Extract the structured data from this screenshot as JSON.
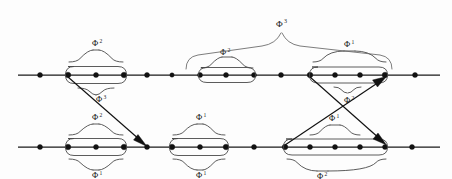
{
  "figure": {
    "background_color": "#fdfdfd",
    "ink_color": "#111111",
    "brace_color": "#4a4a4a",
    "width": 452,
    "height": 179,
    "symbol_base": "Φ"
  },
  "lines": [
    {
      "id": "top-line",
      "y": 75,
      "x_start": 18,
      "x_end": 440,
      "dots": [
        40,
        68,
        96,
        124,
        147,
        172,
        200,
        226,
        254,
        281,
        310,
        335,
        360,
        385,
        415
      ]
    },
    {
      "id": "bottom-line",
      "y": 147,
      "x_start": 18,
      "x_end": 440,
      "dots": [
        40,
        68,
        96,
        124,
        147,
        172,
        200,
        226,
        254,
        285,
        310,
        335,
        360,
        385,
        412
      ]
    }
  ],
  "labels": {
    "top_left_cluster_above": {
      "base": "Φ",
      "sup": "2",
      "x": 96,
      "y": 46
    },
    "top_left_arrow": {
      "base": "Φ",
      "sup": "3",
      "x": 99,
      "y": 99
    },
    "top_middle_cluster": {
      "base": "Φ",
      "sup": "2",
      "x": 224,
      "y": 56
    },
    "top_big_brace": {
      "base": "Φ",
      "sup": "3",
      "x": 282,
      "y": 26
    },
    "top_right_cluster_above": {
      "base": "Φ",
      "sup": "1",
      "x": 348,
      "y": 56
    },
    "top_right_cluster_below": {
      "base": "Φ",
      "sup": "2",
      "x": 348,
      "y": 97
    },
    "bottom_left_cluster_above": {
      "base": "Φ",
      "sup": "2",
      "x": 96,
      "y": 130
    },
    "bottom_left_cluster_below": {
      "base": "Φ",
      "sup": "1",
      "x": 96,
      "y": 170
    },
    "bottom_middle_cluster_above": {
      "base": "Φ",
      "sup": "1",
      "x": 200,
      "y": 130
    },
    "bottom_middle_cluster_below": {
      "base": "Φ",
      "sup": "1",
      "x": 200,
      "y": 170
    },
    "bottom_right_cluster_above": {
      "base": "Φ",
      "sup": "1",
      "x": 333,
      "y": 130
    },
    "bottom_right_cluster_below": {
      "base": "Φ",
      "sup": "2",
      "x": 322,
      "y": 172
    }
  },
  "clusters": [
    {
      "id": "top-left-capsule",
      "line": "top",
      "x1": 68,
      "x2": 124,
      "y": 75
    },
    {
      "id": "top-middle-capsule",
      "line": "top",
      "x1": 200,
      "x2": 254,
      "y": 75
    },
    {
      "id": "top-right-capsule",
      "line": "top",
      "x1": 310,
      "x2": 385,
      "y": 75
    },
    {
      "id": "bottom-left-capsule",
      "line": "bottom",
      "x1": 68,
      "x2": 124,
      "y": 147
    },
    {
      "id": "bottom-middle-capsule",
      "line": "bottom",
      "x1": 172,
      "x2": 226,
      "y": 147
    },
    {
      "id": "bottom-right-capsule",
      "line": "bottom",
      "x1": 285,
      "x2": 385,
      "y": 147
    }
  ],
  "arrows": [
    {
      "id": "arrow-phi3",
      "x1": 68,
      "y1": 77,
      "x2": 147,
      "y2": 146,
      "label": "Φ³"
    },
    {
      "id": "arrow-down-right",
      "x1": 310,
      "y1": 77,
      "x2": 386,
      "y2": 145,
      "label": ""
    },
    {
      "id": "arrow-up-right",
      "x1": 285,
      "y1": 145,
      "x2": 386,
      "y2": 77,
      "label": ""
    }
  ]
}
